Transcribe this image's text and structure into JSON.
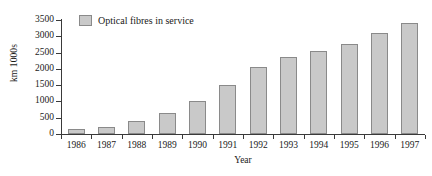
{
  "chart_data": {
    "type": "bar",
    "title": "",
    "subtitle": "",
    "xlabel": "Year",
    "ylabel": "km 1000s",
    "categories": [
      "1986",
      "1987",
      "1988",
      "1989",
      "1990",
      "1991",
      "1992",
      "1993",
      "1994",
      "1995",
      "1996",
      "1997"
    ],
    "values": [
      150,
      220,
      400,
      650,
      1000,
      1500,
      2050,
      2350,
      2550,
      2750,
      3100,
      3400
    ],
    "series": [
      {
        "name": "Optical fibres in service",
        "values": [
          150,
          220,
          400,
          650,
          1000,
          1500,
          2050,
          2350,
          2550,
          2750,
          3100,
          3400
        ]
      }
    ],
    "ylim": [
      0,
      3500
    ],
    "yticks": [
      0,
      500,
      1000,
      1500,
      2000,
      2500,
      3000,
      3500
    ],
    "ytick_labels": [
      "0",
      "500",
      "1000",
      "1500",
      "2000",
      "2500",
      "3000",
      "3500"
    ],
    "grid": false,
    "legend": {
      "position": "top-left-inside",
      "entries": [
        "Optical fibres in service"
      ]
    },
    "colors": {
      "bar_fill": "#c9c9c9",
      "bar_border": "#8a8a8a",
      "axis": "#3a3a3a",
      "text": "#1a1a1a",
      "background": "#ffffff"
    }
  },
  "legend": {
    "label": "Optical fibres in service"
  },
  "axes": {
    "y_title": "km 1000s",
    "x_title": "Year"
  }
}
